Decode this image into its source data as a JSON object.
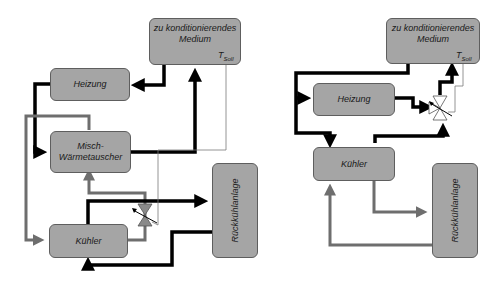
{
  "left_diagram": {
    "medium": {
      "line1": "zu konditionierendes",
      "line2": "Medium"
    },
    "tsoll": {
      "symbol": "T",
      "subscript": "Soll"
    },
    "heizung": "Heizung",
    "mischer": {
      "line1": "Misch-",
      "line2": "Wärmetauscher"
    },
    "kuehler": "Kühler",
    "rueckkuehl": "Rückkühlanlage"
  },
  "right_diagram": {
    "medium": {
      "line1": "zu konditionierendes",
      "line2": "Medium"
    },
    "tsoll": {
      "symbol": "T",
      "subscript": "Soll"
    },
    "heizung": "Heizung",
    "kuehler": "Kühler",
    "rueckkuehl": "Rückkühlanlage"
  },
  "colors": {
    "box_fill": "#a5a5a5",
    "box_border": "#5e5e5e",
    "black_line": "#000000",
    "gray_line": "#6e6e6e",
    "thin_line": "#7a7a7a"
  }
}
